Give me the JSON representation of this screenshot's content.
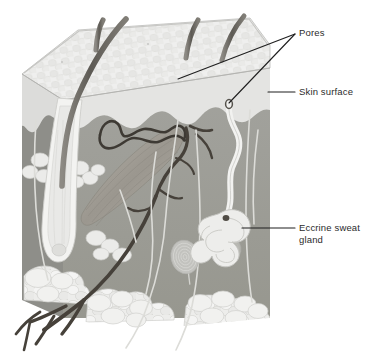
{
  "figure": {
    "background_color": "#ffffff"
  },
  "labels": [
    {
      "id": "pores",
      "text": "Pores",
      "x": 299,
      "y": 27,
      "color": "#2b2b2b"
    },
    {
      "id": "skin-surface",
      "text": "Skin surface",
      "x": 299,
      "y": 86,
      "color": "#2b2b2b"
    },
    {
      "id": "eccrine-sweat-gland",
      "text": "Eccrine sweat\ngland",
      "x": 299,
      "y": 222,
      "color": "#2b2b2b"
    }
  ],
  "leader_lines": [
    {
      "id": "pores-to-epidermis",
      "from": [
        295,
        34
      ],
      "to": [
        178,
        79
      ]
    },
    {
      "id": "pores-to-pore-opening",
      "from": [
        295,
        34
      ],
      "to": [
        229,
        104
      ]
    },
    {
      "id": "skin-surface-line",
      "from": [
        295,
        92
      ],
      "to": [
        268,
        92
      ]
    },
    {
      "id": "eccrine-line",
      "from": [
        295,
        228
      ],
      "to": [
        242,
        228
      ]
    }
  ],
  "anatomy": {
    "regions": [
      {
        "name": "epidermis-top-surface",
        "fill": "#ececeb",
        "description": "Textured cobblestone top face of the skin block"
      },
      {
        "name": "epidermis-layer",
        "fill": "#e3e3e1",
        "description": "Pale epidermal band on the cut faces"
      },
      {
        "name": "dermis",
        "fill": "#9d9d98",
        "description": "Medium grey dermal layer"
      },
      {
        "name": "dermis-left-face",
        "fill": "#8e8e8a",
        "description": "Shaded left side face of the block"
      },
      {
        "name": "subcutaneous-fat",
        "fill": "#e8e8e6",
        "description": "Fat lobules at the base"
      }
    ],
    "structures": [
      {
        "name": "hair-shaft",
        "count": 4,
        "color": "#6d6a64"
      },
      {
        "name": "hair-follicle",
        "count": 1,
        "color": "#f2f2f0"
      },
      {
        "name": "sebaceous-gland",
        "count": 3,
        "color": "#e9e9e7"
      },
      {
        "name": "arrector-pili-muscle",
        "count": 1,
        "color": "#a8a49c"
      },
      {
        "name": "blood-vessel",
        "count": 6,
        "color": "#4a453e"
      },
      {
        "name": "eccrine-sweat-duct",
        "count": 1,
        "color": "#f0f0ee"
      },
      {
        "name": "eccrine-sweat-gland-coil",
        "count": 1,
        "color": "#ededeb"
      },
      {
        "name": "pore-opening",
        "count": 1,
        "color": "#55524c"
      },
      {
        "name": "pacinian-corpuscle",
        "count": 2,
        "color": "#c8c8c4"
      },
      {
        "name": "nerve-fiber",
        "count": 4,
        "color": "#d6d6d2"
      }
    ]
  },
  "colors": {
    "line": "#1f1f1f",
    "text": "#2b2b2b",
    "background": "#ffffff",
    "dermis": "#9d9d98",
    "epidermis": "#e3e3e1",
    "fat": "#e8e8e6",
    "hair": "#6d6a64",
    "vessel": "#4a453e"
  }
}
